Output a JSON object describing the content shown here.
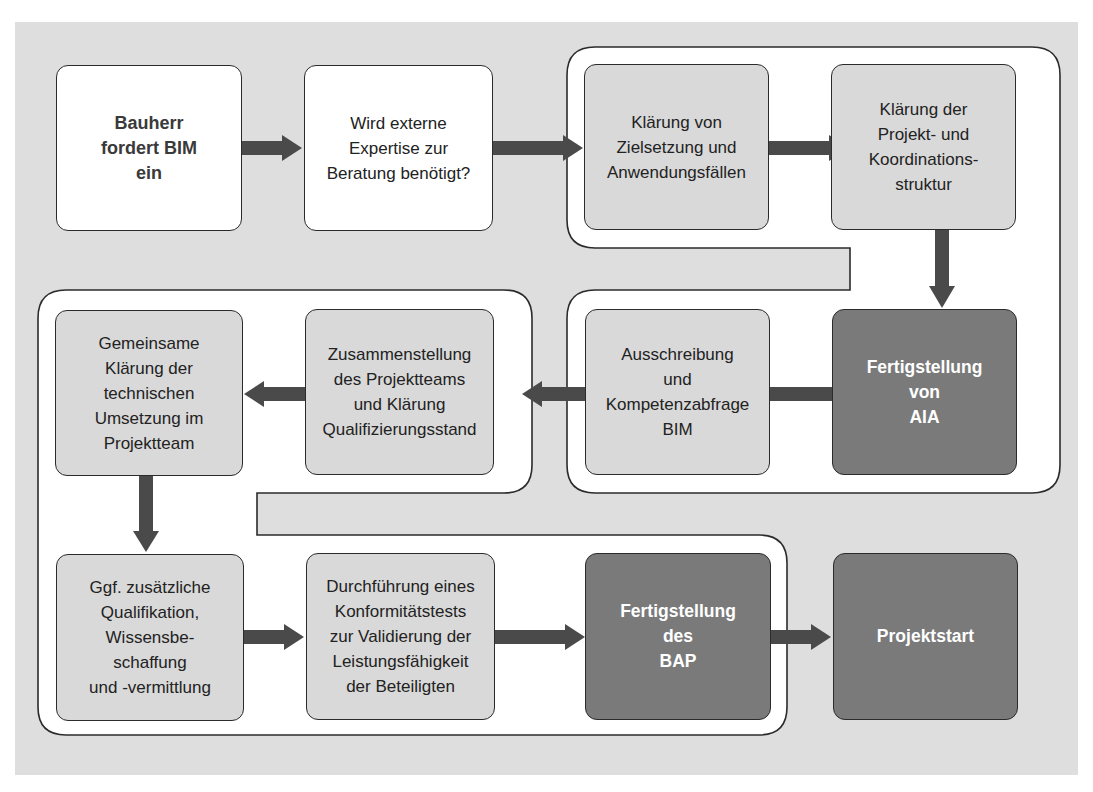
{
  "diagram": {
    "type": "process-flowchart",
    "language": "de",
    "colors": {
      "background": "#dedede",
      "band": "#ffffff",
      "box_white": "#ffffff",
      "box_light": "#d9d9d9",
      "box_dark": "#7a7a7a",
      "arrow": "#4a4a4a",
      "outline": "#2b2b2b"
    },
    "steps": [
      {
        "id": "s1",
        "label": "Bauherr\nfordert BIM\nein",
        "style": "white-bold"
      },
      {
        "id": "s2",
        "label": "Wird externe\nExpertise zur\nBeratung benötigt?",
        "style": "white"
      },
      {
        "id": "s3",
        "label": "Klärung von\nZielsetzung und\nAnwendungsfällen",
        "style": "light"
      },
      {
        "id": "s4",
        "label": "Klärung der\nProjekt- und\nKoordinations-\nstruktur",
        "style": "light"
      },
      {
        "id": "s5",
        "label": "Fertigstellung\nvon\nAIA",
        "style": "dark"
      },
      {
        "id": "s6",
        "label": "Ausschreibung\nund\nKompetenzabfrage\nBIM",
        "style": "light"
      },
      {
        "id": "s7",
        "label": "Zusammenstellung\ndes Projektteams\nund Klärung\nQualifizierungsstand",
        "style": "light"
      },
      {
        "id": "s8",
        "label": "Gemeinsame\nKlärung der\ntechnischen\nUmsetzung im\nProjektteam",
        "style": "light"
      },
      {
        "id": "s9",
        "label": "Ggf. zusätzliche\nQualifikation,\nWissensbe-\nschaffung\nund -vermittlung",
        "style": "light"
      },
      {
        "id": "s10",
        "label": "Durchführung eines\nKonformitätstests\nzur Validierung der\nLeistungsfähigkeit\nder Beteiligten",
        "style": "light"
      },
      {
        "id": "s11",
        "label": "Fertigstellung\ndes\nBAP",
        "style": "dark"
      },
      {
        "id": "s12",
        "label": "Projektstart",
        "style": "dark"
      }
    ],
    "edges": [
      [
        "s1",
        "s2"
      ],
      [
        "s2",
        "s3"
      ],
      [
        "s3",
        "s4"
      ],
      [
        "s4",
        "s5"
      ],
      [
        "s5",
        "s6"
      ],
      [
        "s6",
        "s7"
      ],
      [
        "s7",
        "s8"
      ],
      [
        "s8",
        "s9"
      ],
      [
        "s9",
        "s10"
      ],
      [
        "s10",
        "s11"
      ],
      [
        "s11",
        "s12"
      ]
    ]
  }
}
